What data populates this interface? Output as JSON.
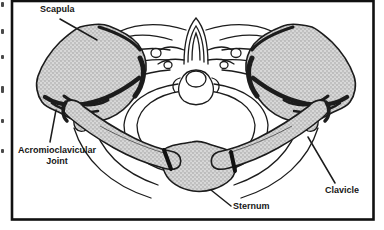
{
  "figure": {
    "labels": {
      "scapula": "Scapula",
      "acromioclavicular_line1": "Acromioclavicular",
      "acromioclavicular_line2": "Joint",
      "sternum": "Sternum",
      "clavicle": "Clavicle"
    },
    "colors": {
      "outline": "#1c1c1c",
      "bone_fill": "#d8d8d8",
      "stipple_dot": "#8c8c8c",
      "background": "#ffffff",
      "frame": "#111111"
    }
  }
}
